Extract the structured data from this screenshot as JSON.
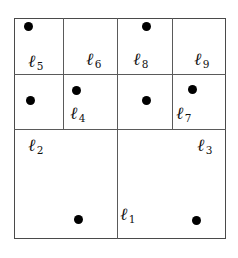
{
  "figure": {
    "type": "partition-diagram",
    "width": 238,
    "height": 258,
    "colors": {
      "background": "#ffffff",
      "frame_stroke": "#4a4a4a",
      "divider_stroke": "#5a5a5a",
      "point_fill": "#000000",
      "label_color": "#111111"
    },
    "frame": {
      "x": 14,
      "y": 18,
      "width": 212,
      "height": 221
    }
  },
  "dividers": [
    {
      "name": "divider-top-band-left",
      "orientation": "h",
      "x": 14,
      "y": 74,
      "length": 104
    },
    {
      "name": "divider-top-band-right",
      "orientation": "h",
      "x": 118,
      "y": 74,
      "length": 108
    },
    {
      "name": "divider-mid-horizontal",
      "orientation": "h",
      "x": 14,
      "y": 129,
      "length": 212
    },
    {
      "name": "divider-center-vertical",
      "orientation": "v",
      "x": 117,
      "y": 18,
      "length": 221
    },
    {
      "name": "divider-left-upper-vertical",
      "orientation": "v",
      "x": 63,
      "y": 18,
      "length": 111
    },
    {
      "name": "divider-right-upper-vertical",
      "orientation": "v",
      "x": 172,
      "y": 18,
      "length": 111
    }
  ],
  "regions": [
    {
      "id": "l1",
      "ell": "ℓ",
      "subscript": "1",
      "label_x": 128,
      "label_y": 215,
      "cell": {
        "x": 118,
        "y": 130,
        "width": 108,
        "height": 109
      }
    },
    {
      "id": "l2",
      "ell": "ℓ",
      "subscript": "2",
      "label_x": 36,
      "label_y": 146,
      "cell": {
        "x": 14,
        "y": 130,
        "width": 103,
        "height": 109
      }
    },
    {
      "id": "l3",
      "ell": "ℓ",
      "subscript": "3",
      "label_x": 205,
      "label_y": 146,
      "cell": {
        "x": 118,
        "y": 130,
        "width": 108,
        "height": 109
      }
    },
    {
      "id": "l4",
      "ell": "ℓ",
      "subscript": "4",
      "label_x": 78,
      "label_y": 114,
      "cell": {
        "x": 64,
        "y": 75,
        "width": 53,
        "height": 54
      }
    },
    {
      "id": "l5",
      "ell": "ℓ",
      "subscript": "5",
      "label_x": 36,
      "label_y": 62,
      "cell": {
        "x": 14,
        "y": 18,
        "width": 49,
        "height": 56
      }
    },
    {
      "id": "l6",
      "ell": "ℓ",
      "subscript": "6",
      "label_x": 94,
      "label_y": 60,
      "cell": {
        "x": 64,
        "y": 18,
        "width": 53,
        "height": 56
      }
    },
    {
      "id": "l7",
      "ell": "ℓ",
      "subscript": "7",
      "label_x": 184,
      "label_y": 114,
      "cell": {
        "x": 173,
        "y": 75,
        "width": 53,
        "height": 54
      }
    },
    {
      "id": "l8",
      "ell": "ℓ",
      "subscript": "8",
      "label_x": 141,
      "label_y": 60,
      "cell": {
        "x": 118,
        "y": 18,
        "width": 54,
        "height": 56
      }
    },
    {
      "id": "l9",
      "ell": "ℓ",
      "subscript": "9",
      "label_x": 202,
      "label_y": 60,
      "cell": {
        "x": 173,
        "y": 18,
        "width": 53,
        "height": 56
      }
    }
  ],
  "points": [
    {
      "name": "point-in-l5-top",
      "x": 28,
      "y": 26
    },
    {
      "name": "point-in-l5-lower",
      "x": 30,
      "y": 100
    },
    {
      "name": "point-in-l4",
      "x": 76,
      "y": 90
    },
    {
      "name": "point-in-l8-top",
      "x": 146,
      "y": 26
    },
    {
      "name": "point-in-l8-lower",
      "x": 146,
      "y": 100
    },
    {
      "name": "point-in-l7",
      "x": 192,
      "y": 89
    },
    {
      "name": "point-in-l2",
      "x": 78,
      "y": 219
    },
    {
      "name": "point-in-l3",
      "x": 196,
      "y": 220
    }
  ]
}
